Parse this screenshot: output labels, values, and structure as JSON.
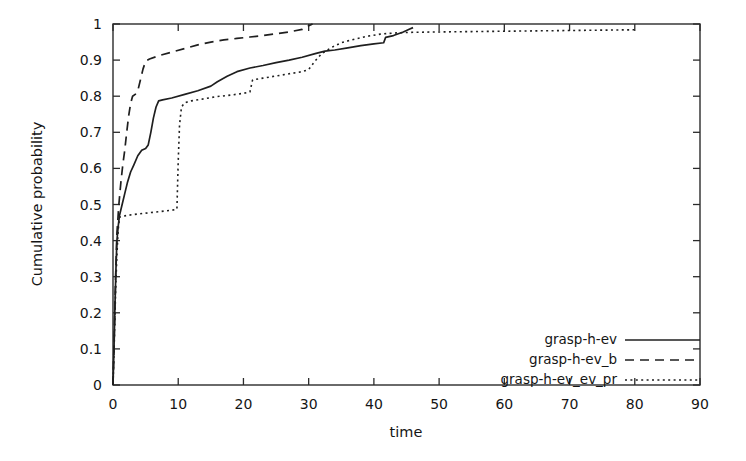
{
  "chart_data": {
    "type": "line",
    "title": "",
    "xlabel": "time",
    "ylabel": "Cumulative probability",
    "xlim": [
      0,
      90
    ],
    "ylim": [
      0,
      1
    ],
    "xticks": [
      "0",
      "10",
      "20",
      "30",
      "40",
      "50",
      "60",
      "70",
      "80",
      "90"
    ],
    "xtick_values": [
      0,
      10,
      20,
      30,
      40,
      50,
      60,
      70,
      80,
      90
    ],
    "yticks": [
      "0",
      "0.1",
      "0.2",
      "0.3",
      "0.4",
      "0.5",
      "0.6",
      "0.7",
      "0.8",
      "0.9",
      "1"
    ],
    "ytick_values": [
      0,
      0.1,
      0.2,
      0.3,
      0.4,
      0.5,
      0.6,
      0.7,
      0.8,
      0.9,
      1.0
    ],
    "grid": false,
    "legend_position": "lower right",
    "series": [
      {
        "name": "grasp-h-ev",
        "style": "solid",
        "points": [
          [
            0.0,
            0.0
          ],
          [
            0.15,
            0.1
          ],
          [
            0.3,
            0.22
          ],
          [
            0.45,
            0.32
          ],
          [
            0.6,
            0.4
          ],
          [
            0.8,
            0.44
          ],
          [
            1.0,
            0.47
          ],
          [
            1.4,
            0.5
          ],
          [
            1.8,
            0.53
          ],
          [
            2.2,
            0.56
          ],
          [
            2.7,
            0.59
          ],
          [
            3.2,
            0.61
          ],
          [
            3.8,
            0.635
          ],
          [
            4.4,
            0.65
          ],
          [
            5.0,
            0.655
          ],
          [
            5.4,
            0.665
          ],
          [
            5.8,
            0.7
          ],
          [
            6.2,
            0.74
          ],
          [
            6.6,
            0.77
          ],
          [
            7.0,
            0.787
          ],
          [
            7.6,
            0.79
          ],
          [
            9.0,
            0.795
          ],
          [
            11.0,
            0.805
          ],
          [
            13.0,
            0.815
          ],
          [
            15.0,
            0.828
          ],
          [
            16.0,
            0.84
          ],
          [
            17.5,
            0.855
          ],
          [
            19.0,
            0.868
          ],
          [
            21.0,
            0.878
          ],
          [
            23.0,
            0.885
          ],
          [
            25.0,
            0.893
          ],
          [
            27.0,
            0.9
          ],
          [
            29.0,
            0.908
          ],
          [
            31.0,
            0.918
          ],
          [
            32.5,
            0.925
          ],
          [
            34.0,
            0.928
          ],
          [
            36.0,
            0.934
          ],
          [
            38.0,
            0.94
          ],
          [
            40.0,
            0.945
          ],
          [
            41.5,
            0.948
          ],
          [
            41.8,
            0.963
          ],
          [
            43.0,
            0.968
          ],
          [
            44.5,
            0.978
          ],
          [
            45.5,
            0.986
          ],
          [
            46.0,
            0.99
          ]
        ]
      },
      {
        "name": "grasp-h-ev_b",
        "style": "dashed",
        "points": [
          [
            0.0,
            0.0
          ],
          [
            0.2,
            0.14
          ],
          [
            0.4,
            0.3
          ],
          [
            0.6,
            0.42
          ],
          [
            0.9,
            0.5
          ],
          [
            1.2,
            0.56
          ],
          [
            1.5,
            0.61
          ],
          [
            1.8,
            0.65
          ],
          [
            2.1,
            0.7
          ],
          [
            2.4,
            0.745
          ],
          [
            2.7,
            0.78
          ],
          [
            3.0,
            0.8
          ],
          [
            3.4,
            0.805
          ],
          [
            3.8,
            0.815
          ],
          [
            4.2,
            0.845
          ],
          [
            4.6,
            0.875
          ],
          [
            5.0,
            0.897
          ],
          [
            5.6,
            0.903
          ],
          [
            7.0,
            0.912
          ],
          [
            9.0,
            0.922
          ],
          [
            11.0,
            0.932
          ],
          [
            13.0,
            0.942
          ],
          [
            15.0,
            0.95
          ],
          [
            17.0,
            0.956
          ],
          [
            19.0,
            0.96
          ],
          [
            21.0,
            0.964
          ],
          [
            23.0,
            0.968
          ],
          [
            25.0,
            0.973
          ],
          [
            27.0,
            0.978
          ],
          [
            29.0,
            0.985
          ],
          [
            30.0,
            0.995
          ],
          [
            30.6,
            1.0
          ]
        ]
      },
      {
        "name": "grasp-h-ev_ev_pr",
        "style": "dotted",
        "points": [
          [
            0.0,
            0.0
          ],
          [
            0.2,
            0.12
          ],
          [
            0.4,
            0.26
          ],
          [
            0.6,
            0.36
          ],
          [
            0.8,
            0.43
          ],
          [
            1.0,
            0.465
          ],
          [
            1.6,
            0.468
          ],
          [
            3.0,
            0.472
          ],
          [
            5.0,
            0.476
          ],
          [
            7.0,
            0.48
          ],
          [
            9.0,
            0.484
          ],
          [
            9.8,
            0.487
          ],
          [
            10.0,
            0.62
          ],
          [
            10.2,
            0.72
          ],
          [
            10.5,
            0.77
          ],
          [
            11.0,
            0.782
          ],
          [
            12.0,
            0.787
          ],
          [
            14.0,
            0.793
          ],
          [
            16.0,
            0.799
          ],
          [
            18.0,
            0.803
          ],
          [
            20.0,
            0.808
          ],
          [
            21.0,
            0.812
          ],
          [
            21.4,
            0.845
          ],
          [
            23.0,
            0.85
          ],
          [
            25.0,
            0.856
          ],
          [
            27.0,
            0.862
          ],
          [
            29.0,
            0.868
          ],
          [
            30.0,
            0.874
          ],
          [
            31.0,
            0.898
          ],
          [
            32.0,
            0.918
          ],
          [
            33.5,
            0.935
          ],
          [
            35.0,
            0.948
          ],
          [
            37.0,
            0.958
          ],
          [
            39.0,
            0.966
          ],
          [
            41.0,
            0.972
          ],
          [
            43.0,
            0.975
          ],
          [
            46.0,
            0.977
          ],
          [
            50.0,
            0.978
          ],
          [
            55.0,
            0.979
          ],
          [
            60.0,
            0.98
          ],
          [
            65.0,
            0.981
          ],
          [
            70.0,
            0.982
          ],
          [
            75.0,
            0.983
          ],
          [
            80.0,
            0.984
          ]
        ]
      }
    ]
  },
  "legend": {
    "entries": [
      {
        "label": "grasp-h-ev",
        "style": "solid"
      },
      {
        "label": "grasp-h-ev_b",
        "style": "dashed"
      },
      {
        "label": "grasp-h-ev_ev_pr",
        "style": "dotted"
      }
    ]
  }
}
